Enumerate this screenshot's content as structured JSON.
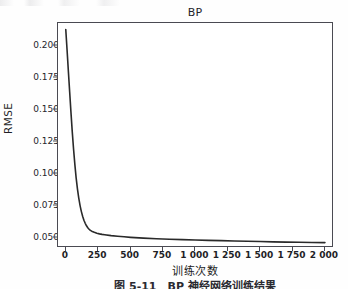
{
  "figure": {
    "title": "BP",
    "caption": "图 5-11　BP 神经网络训练结果"
  },
  "axes": {
    "ylabel": "RMSE",
    "xlabel": "训练次数",
    "yticks": [
      "0.200",
      "0.175",
      "0.150",
      "0.125",
      "0.100",
      "0.075",
      "0.050"
    ],
    "xticks": [
      "0",
      "250",
      "500",
      "750",
      "1 000",
      "1 250",
      "1 500",
      "1 750",
      "2 000"
    ]
  },
  "chart_data": {
    "type": "line",
    "title": "BP",
    "xlabel": "训练次数",
    "ylabel": "RMSE",
    "xlim": [
      -60,
      2070
    ],
    "ylim": [
      0.0425,
      0.2175
    ],
    "grid": false,
    "legend": null,
    "ytick_values": [
      0.2,
      0.175,
      0.15,
      0.125,
      0.1,
      0.075,
      0.05
    ],
    "xtick_values": [
      0,
      250,
      500,
      750,
      1000,
      1250,
      1500,
      1750,
      2000
    ],
    "series": [
      {
        "name": "BP",
        "color": "#2a2a2a",
        "linewidth": 1.6,
        "x": [
          0,
          10,
          20,
          30,
          40,
          50,
          60,
          70,
          80,
          90,
          100,
          110,
          120,
          130,
          140,
          150,
          160,
          170,
          180,
          190,
          200,
          220,
          240,
          260,
          280,
          300,
          350,
          400,
          450,
          500,
          600,
          700,
          800,
          900,
          1000,
          1100,
          1200,
          1300,
          1400,
          1500,
          1600,
          1700,
          1800,
          1900,
          2000
        ],
        "y": [
          0.2125,
          0.1965,
          0.18,
          0.164,
          0.148,
          0.133,
          0.1195,
          0.1075,
          0.097,
          0.0885,
          0.0815,
          0.0757,
          0.071,
          0.0672,
          0.0641,
          0.0617,
          0.0598,
          0.0583,
          0.0571,
          0.0562,
          0.0556,
          0.0547,
          0.054,
          0.0535,
          0.0531,
          0.0528,
          0.0521,
          0.0516,
          0.0512,
          0.0508,
          0.0502,
          0.0497,
          0.0493,
          0.049,
          0.0487,
          0.0484,
          0.0482,
          0.0479,
          0.0477,
          0.0475,
          0.0473,
          0.0471,
          0.047,
          0.0468,
          0.0467
        ]
      }
    ]
  }
}
